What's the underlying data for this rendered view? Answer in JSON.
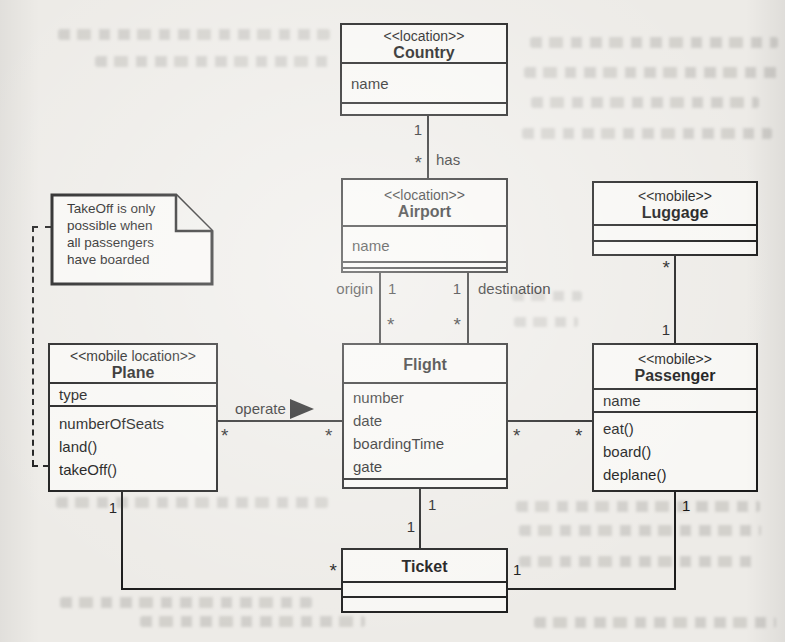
{
  "note": {
    "text": "TakeOff is only\npossible when\nall passengers\nhave boarded"
  },
  "classes": {
    "country": {
      "stereotype": "<<location>>",
      "name": "Country",
      "attributes": [
        "name"
      ]
    },
    "airport": {
      "stereotype": "<<location>>",
      "name": "Airport",
      "attributes": [
        "name"
      ]
    },
    "luggage": {
      "stereotype": "<<mobile>>",
      "name": "Luggage"
    },
    "plane": {
      "stereotype": "<<mobile location>>",
      "name": "Plane",
      "attributes": [
        "type"
      ],
      "members": [
        "numberOfSeats",
        "land()",
        "takeOff()"
      ]
    },
    "flight": {
      "name": "Flight",
      "attributes": [
        "number",
        "date",
        "boardingTime",
        "gate"
      ]
    },
    "passenger": {
      "stereotype": "<<mobile>>",
      "name": "Passenger",
      "attributes": [
        "name"
      ],
      "operations": [
        "eat()",
        "board()",
        "deplane()"
      ]
    },
    "ticket": {
      "name": "Ticket"
    }
  },
  "associations": {
    "country_airport": {
      "name": "has",
      "country_end": "1",
      "airport_end": "*"
    },
    "airport_flight_origin": {
      "role": "origin",
      "airport_end": "1",
      "flight_end": "*"
    },
    "airport_flight_destination": {
      "role": "destination",
      "airport_end": "1",
      "flight_end": "*"
    },
    "plane_flight": {
      "name": "operate",
      "plane_end": "*",
      "flight_end": "*"
    },
    "flight_passenger": {
      "flight_end": "*",
      "passenger_end": "*"
    },
    "luggage_passenger": {
      "luggage_end": "*",
      "passenger_end": "1"
    },
    "plane_ticket": {
      "plane_end": "1",
      "ticket_end": "*"
    },
    "flight_ticket": {
      "flight_end": "1",
      "ticket_end": "1"
    },
    "passenger_ticket": {
      "passenger_end": "1",
      "ticket_end": "1"
    }
  },
  "colors": {
    "ink": "#1b1b1b",
    "paper": "#edebe7",
    "box_fill": "#f8f7f4"
  }
}
